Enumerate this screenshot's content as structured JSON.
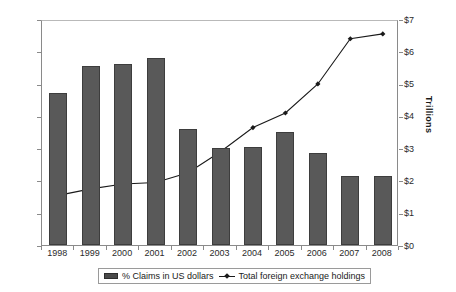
{
  "chart_data": {
    "type": "bar",
    "title": "",
    "subtitle": "",
    "xlabel": "",
    "ylabel": "",
    "ylabel_right": "Trillions",
    "categories": [
      "1998",
      "1999",
      "2000",
      "2001",
      "2002",
      "2003",
      "2004",
      "2005",
      "2006",
      "2007",
      "2008"
    ],
    "grid": false,
    "legend_position": "bottom",
    "axes": {
      "left": {
        "label": "",
        "min": 60,
        "max": 74,
        "step": 2,
        "unit": "%",
        "ticks": [
          "60%",
          "62%",
          "64%",
          "66%",
          "68%",
          "70%",
          "72%",
          "74%"
        ],
        "tick_values": [
          60,
          62,
          64,
          66,
          68,
          70,
          72,
          74
        ]
      },
      "right": {
        "label": "Trillions",
        "min": 0,
        "max": 7,
        "step": 1,
        "unit": "$",
        "ticks": [
          "$0",
          "$1",
          "$2",
          "$3",
          "$4",
          "$5",
          "$6",
          "$7"
        ],
        "tick_values": [
          0,
          1,
          2,
          3,
          4,
          5,
          6,
          7
        ]
      }
    },
    "series": [
      {
        "name": "% Claims in US dollars",
        "type": "bar",
        "axis": "left",
        "color": "#595959",
        "values": [
          69.4,
          71.1,
          71.2,
          71.6,
          67.2,
          66.0,
          66.1,
          67.0,
          65.7,
          64.3,
          64.3
        ]
      },
      {
        "name": "Total foreign exchange holdings",
        "type": "line",
        "axis": "right",
        "color": "#1a1a1a",
        "marker": "diamond",
        "values": [
          1.6,
          1.8,
          1.95,
          2.0,
          2.3,
          2.95,
          3.7,
          4.15,
          5.05,
          6.45,
          6.6
        ]
      }
    ]
  },
  "legend": {
    "items": [
      {
        "label": "% Claims in US dollars",
        "marker": "bar-swatch"
      },
      {
        "label": "Total foreign exchange holdings",
        "marker": "line-marker-swatch"
      }
    ]
  }
}
